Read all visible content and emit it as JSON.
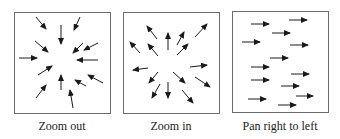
{
  "figure": {
    "colors": {
      "arrow": "#1a1a1a",
      "border": "#6b6b6b",
      "background": "#ffffff"
    },
    "panels": [
      {
        "id": "zoom-out",
        "caption": "Zoom out",
        "box": {
          "x": 14,
          "y": 12,
          "w": 97,
          "h": 102
        },
        "caption_pos": {
          "x": 62,
          "y": 119
        },
        "arrows": [
          [
            36,
            17,
            46,
            29
          ],
          [
            61,
            25,
            61,
            44
          ],
          [
            80,
            17,
            74,
            30
          ],
          [
            35,
            41,
            48,
            52
          ],
          [
            83,
            43,
            73,
            53
          ],
          [
            98,
            43,
            84,
            50
          ],
          [
            19,
            58,
            37,
            58
          ],
          [
            98,
            60,
            77,
            60
          ],
          [
            38,
            75,
            52,
            66
          ],
          [
            61,
            90,
            61,
            75
          ],
          [
            86,
            86,
            75,
            80
          ],
          [
            103,
            83,
            88,
            75
          ],
          [
            36,
            98,
            46,
            85
          ],
          [
            73,
            108,
            70,
            90
          ]
        ]
      },
      {
        "id": "zoom-in",
        "caption": "Zoom in",
        "box": {
          "x": 123,
          "y": 12,
          "w": 97,
          "h": 102
        },
        "caption_pos": {
          "x": 171,
          "y": 119
        },
        "arrows": [
          [
            157,
            39,
            147,
            26
          ],
          [
            168,
            50,
            168,
            33
          ],
          [
            140,
            53,
            130,
            42
          ],
          [
            158,
            56,
            148,
            44
          ],
          [
            177,
            45,
            184,
            32
          ],
          [
            195,
            37,
            207,
            24
          ],
          [
            177,
            55,
            188,
            44
          ],
          [
            148,
            68,
            133,
            70
          ],
          [
            190,
            67,
            207,
            65
          ],
          [
            158,
            72,
            149,
            83
          ],
          [
            173,
            72,
            185,
            83
          ],
          [
            195,
            77,
            210,
            87
          ],
          [
            160,
            84,
            152,
            98
          ],
          [
            168,
            82,
            168,
            98
          ],
          [
            182,
            90,
            193,
            103
          ]
        ]
      },
      {
        "id": "pan-right-to-left",
        "caption": "Pan right to left",
        "box": {
          "x": 232,
          "y": 11,
          "w": 97,
          "h": 102
        },
        "caption_pos": {
          "x": 280,
          "y": 119
        },
        "arrows": [
          [
            251,
            24,
            269,
            24
          ],
          [
            289,
            20,
            307,
            20
          ],
          [
            272,
            33,
            290,
            33
          ],
          [
            242,
            42,
            260,
            42
          ],
          [
            290,
            45,
            308,
            45
          ],
          [
            270,
            58,
            288,
            58
          ],
          [
            251,
            67,
            269,
            67
          ],
          [
            291,
            74,
            309,
            74
          ],
          [
            251,
            80,
            269,
            80
          ],
          [
            281,
            86,
            299,
            86
          ],
          [
            296,
            96,
            313,
            96
          ],
          [
            248,
            99,
            266,
            99
          ],
          [
            278,
            105,
            296,
            105
          ]
        ]
      }
    ]
  }
}
